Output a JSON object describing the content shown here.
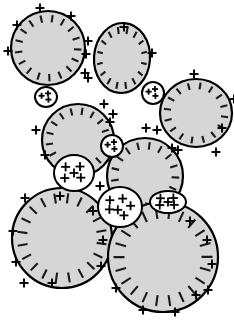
{
  "figure": {
    "width": 234,
    "height": 333,
    "background_color": "#ffffff"
  },
  "style": {
    "droplet_fill": "#d6d6d6",
    "droplet_stroke": "#000000",
    "droplet_stroke_width": 2.2,
    "small_droplet_fill": "#ffffff",
    "small_droplet_stroke": "#000000",
    "small_droplet_stroke_width": 2.0,
    "negative_mark_color": "#1a1a1a",
    "positive_mark_color": "#000000"
  },
  "legend_semantics": {
    "minus_symbol": "−",
    "plus_symbol": "+",
    "negative_label": "negative surface charge",
    "positive_label": "positive charge"
  },
  "negative_droplets": [
    {
      "id": "droplet-top-left",
      "cx": 48,
      "cy": 48,
      "rx": 37,
      "ry": 37,
      "rotation": 0,
      "charge_count": 17,
      "charge_sign": "minus"
    },
    {
      "id": "droplet-top-middle",
      "cx": 122,
      "cy": 58,
      "rx": 28,
      "ry": 35,
      "rotation": 4,
      "charge_count": 16,
      "charge_sign": "minus"
    },
    {
      "id": "droplet-right",
      "cx": 196,
      "cy": 113,
      "rx": 36,
      "ry": 34,
      "rotation": 0,
      "charge_count": 16,
      "charge_sign": "minus"
    },
    {
      "id": "droplet-middle-left",
      "cx": 78,
      "cy": 140,
      "rx": 36,
      "ry": 36,
      "rotation": 0,
      "charge_count": 17,
      "charge_sign": "minus"
    },
    {
      "id": "droplet-middle-right",
      "cx": 145,
      "cy": 176,
      "rx": 38,
      "ry": 38,
      "rotation": 0,
      "charge_count": 17,
      "charge_sign": "minus"
    },
    {
      "id": "droplet-bottom-left",
      "cx": 62,
      "cy": 238,
      "rx": 50,
      "ry": 50,
      "rotation": 0,
      "charge_count": 20,
      "charge_sign": "minus"
    },
    {
      "id": "droplet-bottom-right",
      "cx": 163,
      "cy": 257,
      "rx": 55,
      "ry": 55,
      "rotation": 0,
      "charge_count": 22,
      "charge_sign": "minus"
    }
  ],
  "positive_droplets": [
    {
      "id": "bridge-droplet-upper-left",
      "cx": 46,
      "cy": 97,
      "rx": 11,
      "ry": 10,
      "charge_count": 3,
      "charge_sign": "plus"
    },
    {
      "id": "bridge-droplet-upper-right",
      "cx": 153,
      "cy": 93,
      "rx": 11,
      "ry": 11,
      "charge_count": 3,
      "charge_sign": "plus"
    },
    {
      "id": "bridge-droplet-center",
      "cx": 112,
      "cy": 146,
      "rx": 11,
      "ry": 11,
      "charge_count": 3,
      "charge_sign": "plus"
    },
    {
      "id": "bridge-droplet-lower-left",
      "cx": 74,
      "cy": 173,
      "rx": 20,
      "ry": 18,
      "charge_count": 5,
      "charge_sign": "plus"
    },
    {
      "id": "bridge-droplet-lower-mid",
      "cx": 120,
      "cy": 207,
      "rx": 22,
      "ry": 20,
      "charge_count": 6,
      "charge_sign": "plus"
    },
    {
      "id": "bridge-droplet-lower-right",
      "cx": 168,
      "cy": 202,
      "rx": 18,
      "ry": 11,
      "charge_count": 5,
      "charge_sign": "plus"
    }
  ],
  "free_positive_ions": [
    {
      "x": 40,
      "y": 8
    },
    {
      "x": 71,
      "y": 16
    },
    {
      "x": 17,
      "y": 25
    },
    {
      "x": 8,
      "y": 51
    },
    {
      "x": 124,
      "y": 27
    },
    {
      "x": 88,
      "y": 41
    },
    {
      "x": 86,
      "y": 54
    },
    {
      "x": 85,
      "y": 73
    },
    {
      "x": 88,
      "y": 78
    },
    {
      "x": 152,
      "y": 53
    },
    {
      "x": 194,
      "y": 74
    },
    {
      "x": 234,
      "y": 99
    },
    {
      "x": 222,
      "y": 128
    },
    {
      "x": 216,
      "y": 152
    },
    {
      "x": 104,
      "y": 104
    },
    {
      "x": 113,
      "y": 114
    },
    {
      "x": 110,
      "y": 122
    },
    {
      "x": 36,
      "y": 130
    },
    {
      "x": 45,
      "y": 155
    },
    {
      "x": 146,
      "y": 128
    },
    {
      "x": 157,
      "y": 130
    },
    {
      "x": 172,
      "y": 148
    },
    {
      "x": 178,
      "y": 150
    },
    {
      "x": 25,
      "y": 198
    },
    {
      "x": 13,
      "y": 231
    },
    {
      "x": 16,
      "y": 262
    },
    {
      "x": 24,
      "y": 283
    },
    {
      "x": 52,
      "y": 283
    },
    {
      "x": 101,
      "y": 266
    },
    {
      "x": 103,
      "y": 240
    },
    {
      "x": 93,
      "y": 211
    },
    {
      "x": 190,
      "y": 221
    },
    {
      "x": 207,
      "y": 240
    },
    {
      "x": 212,
      "y": 264
    },
    {
      "x": 208,
      "y": 290
    },
    {
      "x": 116,
      "y": 288
    },
    {
      "x": 143,
      "y": 310
    },
    {
      "x": 175,
      "y": 312
    },
    {
      "x": 196,
      "y": 295
    },
    {
      "x": 60,
      "y": 196
    },
    {
      "x": 100,
      "y": 186
    }
  ]
}
